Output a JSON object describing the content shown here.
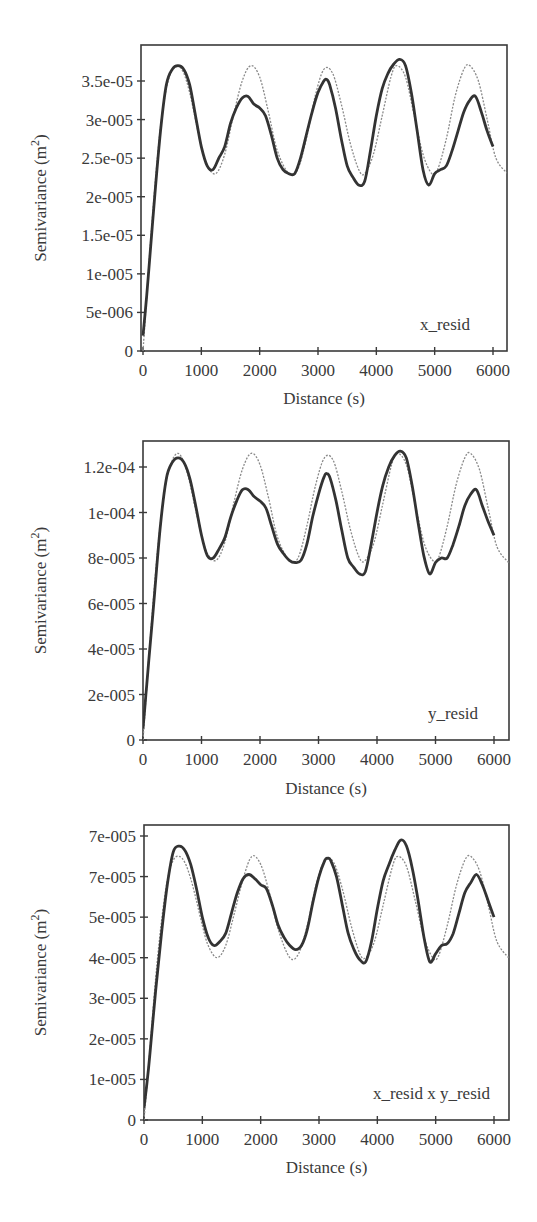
{
  "figure": {
    "x_axis_title": "Distance (s)",
    "y_axis_title": "Semivariance (m",
    "y_axis_title_sup": "2",
    "y_axis_title_end": ")"
  },
  "chart_data": [
    {
      "type": "line",
      "panel_label": "x_resid",
      "xlabel": "Distance (s)",
      "ylabel": "Semivariance (m^2)",
      "xlim": [
        0,
        6250
      ],
      "ylim": [
        0,
        3.85e-05
      ],
      "x_ticks": [
        0,
        1000,
        2000,
        3000,
        4000,
        5000,
        6000
      ],
      "x_tick_labels": [
        "0",
        "1000",
        "2000",
        "3000",
        "4000",
        "5000",
        "6000"
      ],
      "y_ticks": [
        0,
        5e-06,
        1e-05,
        1.5e-05,
        2e-05,
        2.5e-05,
        3e-05,
        3.5e-05
      ],
      "y_tick_labels": [
        "0",
        "5e-006",
        "1e-005",
        "1.5e-05",
        "2e-005",
        "2.5e-05",
        "3e-005",
        "3.5e-05"
      ],
      "grid": false,
      "series": [
        {
          "name": "empirical semivariogram",
          "style": "thick",
          "x": [
            0,
            50,
            100,
            200,
            300,
            400,
            500,
            600,
            700,
            800,
            900,
            1000,
            1100,
            1200,
            1300,
            1400,
            1500,
            1600,
            1700,
            1800,
            1900,
            2000,
            2100,
            2200,
            2300,
            2400,
            2500,
            2600,
            2700,
            2800,
            2900,
            3000,
            3100,
            3150,
            3200,
            3300,
            3400,
            3500,
            3600,
            3700,
            3800,
            3900,
            4000,
            4100,
            4200,
            4300,
            4400,
            4500,
            4600,
            4700,
            4800,
            4900,
            5000,
            5100,
            5200,
            5300,
            5400,
            5500,
            5600,
            5700,
            5800,
            5900,
            6000
          ],
          "values": [
            2e-06,
            6e-06,
            1.05e-05,
            2e-05,
            2.85e-05,
            3.45e-05,
            3.65e-05,
            3.7e-05,
            3.65e-05,
            3.45e-05,
            3.05e-05,
            2.65e-05,
            2.4e-05,
            2.35e-05,
            2.5e-05,
            2.65e-05,
            2.95e-05,
            3.15e-05,
            3.28e-05,
            3.3e-05,
            3.2e-05,
            3.15e-05,
            3.05e-05,
            2.8e-05,
            2.5e-05,
            2.35e-05,
            2.3e-05,
            2.3e-05,
            2.5e-05,
            2.8e-05,
            3.1e-05,
            3.35e-05,
            3.5e-05,
            3.52e-05,
            3.45e-05,
            3.15e-05,
            2.75e-05,
            2.4e-05,
            2.25e-05,
            2.15e-05,
            2.2e-05,
            2.6e-05,
            3.05e-05,
            3.4e-05,
            3.6e-05,
            3.72e-05,
            3.78e-05,
            3.7e-05,
            3.35e-05,
            2.85e-05,
            2.35e-05,
            2.15e-05,
            2.3e-05,
            2.35e-05,
            2.4e-05,
            2.6e-05,
            2.85e-05,
            3.1e-05,
            3.25e-05,
            3.3e-05,
            3.1e-05,
            2.85e-05,
            2.65e-05
          ]
        },
        {
          "name": "fitted hole-effect model",
          "style": "thin-dashed",
          "x": [
            0,
            100,
            200,
            300,
            400,
            500,
            600,
            700,
            800,
            900,
            1000,
            1100,
            1250,
            1400,
            1550,
            1700,
            1850,
            2000,
            2150,
            2300,
            2500,
            2650,
            2800,
            2950,
            3100,
            3250,
            3400,
            3550,
            3700,
            3800,
            3950,
            4100,
            4250,
            4350,
            4500,
            4650,
            4800,
            4950,
            5050,
            5200,
            5350,
            5500,
            5600,
            5750,
            5900,
            6050,
            6250
          ],
          "values": [
            0,
            1.1e-05,
            2.1e-05,
            2.9e-05,
            3.4e-05,
            3.65e-05,
            3.7e-05,
            3.6e-05,
            3.35e-05,
            3e-05,
            2.65e-05,
            2.4e-05,
            2.3e-05,
            2.55e-05,
            3.05e-05,
            3.5e-05,
            3.7e-05,
            3.55e-05,
            3.1e-05,
            2.6e-05,
            2.3e-05,
            2.35e-05,
            2.75e-05,
            3.3e-05,
            3.65e-05,
            3.6e-05,
            3.2e-05,
            2.7e-05,
            2.35e-05,
            2.3e-05,
            2.55e-05,
            3.05e-05,
            3.55e-05,
            3.7e-05,
            3.55e-05,
            3.05e-05,
            2.55e-05,
            2.3e-05,
            2.35e-05,
            2.75e-05,
            3.3e-05,
            3.65e-05,
            3.7e-05,
            3.5e-05,
            3e-05,
            2.5e-05,
            2.3e-05
          ]
        }
      ]
    },
    {
      "type": "line",
      "panel_label": "y_resid",
      "xlabel": "Distance (s)",
      "ylabel": "Semivariance (m^2)",
      "xlim": [
        0,
        6250
      ],
      "ylim": [
        0,
        0.000132
      ],
      "x_ticks": [
        0,
        1000,
        2000,
        3000,
        4000,
        5000,
        6000
      ],
      "x_tick_labels": [
        "0",
        "1000",
        "2000",
        "3000",
        "4000",
        "5000",
        "6000"
      ],
      "y_ticks": [
        0,
        2e-05,
        4e-05,
        6e-05,
        8e-05,
        0.0001,
        0.00012
      ],
      "y_tick_labels": [
        "0",
        "2e-005",
        "4e-005",
        "6e-005",
        "8e-005",
        "1e-004",
        "1.2e-04"
      ],
      "grid": false,
      "series": [
        {
          "name": "empirical semivariogram",
          "style": "thick",
          "x": [
            0,
            50,
            100,
            200,
            300,
            400,
            500,
            600,
            700,
            800,
            900,
            1000,
            1100,
            1200,
            1300,
            1400,
            1500,
            1600,
            1700,
            1800,
            1900,
            2000,
            2100,
            2200,
            2300,
            2400,
            2500,
            2600,
            2700,
            2800,
            2900,
            3000,
            3100,
            3150,
            3200,
            3300,
            3400,
            3500,
            3600,
            3700,
            3800,
            3900,
            4000,
            4100,
            4200,
            4300,
            4400,
            4500,
            4600,
            4700,
            4800,
            4900,
            5000,
            5100,
            5200,
            5300,
            5400,
            5500,
            5600,
            5700,
            5800,
            5900,
            6000
          ],
          "values": [
            5e-06,
            2e-05,
            3.5e-05,
            6.5e-05,
            9.5e-05,
            0.000115,
            0.000122,
            0.000124,
            0.000122,
            0.000115,
            0.000103,
            9e-05,
            8.1e-05,
            8e-05,
            8.4e-05,
            8.9e-05,
            9.8e-05,
            0.000105,
            0.00011,
            0.00011,
            0.000107,
            0.000105,
            0.000102,
            9.4e-05,
            8.6e-05,
            8.2e-05,
            7.9e-05,
            7.8e-05,
            7.9e-05,
            8.6e-05,
            9.8e-05,
            0.000108,
            0.000116,
            0.000117,
            0.000115,
            0.000105,
            9.2e-05,
            8e-05,
            7.6e-05,
            7.3e-05,
            7.4e-05,
            8.6e-05,
            0.0001,
            0.000112,
            0.00012,
            0.000125,
            0.000127,
            0.000124,
            0.000112,
            9.6e-05,
            8.1e-05,
            7.3e-05,
            7.8e-05,
            8e-05,
            8e-05,
            8.6e-05,
            9.4e-05,
            0.000103,
            0.000108,
            0.00011,
            0.000103,
            9.6e-05,
            9e-05
          ]
        },
        {
          "name": "fitted hole-effect model",
          "style": "thin-dashed",
          "x": [
            0,
            100,
            200,
            300,
            400,
            500,
            600,
            700,
            800,
            900,
            1000,
            1100,
            1250,
            1400,
            1550,
            1700,
            1850,
            2000,
            2150,
            2300,
            2500,
            2650,
            2800,
            2950,
            3100,
            3250,
            3400,
            3550,
            3700,
            3800,
            3950,
            4100,
            4250,
            4350,
            4500,
            4650,
            4800,
            4950,
            5050,
            5200,
            5350,
            5500,
            5600,
            5750,
            5900,
            6050,
            6250
          ],
          "values": [
            0,
            3.6e-05,
            6.9e-05,
            9.6e-05,
            0.000114,
            0.000123,
            0.000126,
            0.000122,
            0.000113,
            0.000101,
            9e-05,
            8.2e-05,
            7.9e-05,
            8.7e-05,
            0.000104,
            0.000119,
            0.000126,
            0.000121,
            0.000106,
            8.9e-05,
            7.9e-05,
            8e-05,
            9.4e-05,
            0.000112,
            0.000124,
            0.000123,
            0.000109,
            9.2e-05,
            8e-05,
            7.9e-05,
            8.7e-05,
            0.000104,
            0.000121,
            0.000126,
            0.000121,
            0.000104,
            8.7e-05,
            7.9e-05,
            8e-05,
            9.4e-05,
            0.000112,
            0.000124,
            0.000126,
            0.000119,
            0.000102,
            8.5e-05,
            7.8e-05
          ]
        }
      ]
    },
    {
      "type": "line",
      "panel_label": "x_resid x y_resid",
      "xlabel": "Distance (s)",
      "ylabel": "Semivariance (m^2)",
      "xlim": [
        0,
        6250
      ],
      "ylim": [
        0,
        7.3e-05
      ],
      "x_ticks": [
        0,
        1000,
        2000,
        3000,
        4000,
        5000,
        6000
      ],
      "x_tick_labels": [
        "0",
        "1000",
        "2000",
        "3000",
        "4000",
        "5000",
        "6000"
      ],
      "y_ticks": [
        0,
        1e-05,
        2e-05,
        3e-05,
        4e-05,
        5e-05,
        6e-05,
        7e-05
      ],
      "y_tick_labels": [
        "0",
        "1e-005",
        "2e-005",
        "3e-005",
        "4e-005",
        "5e-005",
        "7e-005",
        "7e-005"
      ],
      "grid": false,
      "series": [
        {
          "name": "empirical semivariogram",
          "style": "thick",
          "x": [
            0,
            50,
            100,
            200,
            300,
            400,
            500,
            600,
            700,
            800,
            900,
            1000,
            1100,
            1200,
            1300,
            1400,
            1500,
            1600,
            1700,
            1800,
            1900,
            2000,
            2100,
            2200,
            2300,
            2400,
            2500,
            2600,
            2700,
            2800,
            2900,
            3000,
            3100,
            3150,
            3200,
            3300,
            3400,
            3500,
            3600,
            3700,
            3800,
            3900,
            4000,
            4100,
            4200,
            4300,
            4400,
            4500,
            4600,
            4700,
            4800,
            4900,
            5000,
            5100,
            5200,
            5300,
            5400,
            5500,
            5600,
            5700,
            5800,
            5900,
            6000
          ],
          "values": [
            3e-06,
            9e-06,
            1.6e-05,
            3.2e-05,
            4.6e-05,
            5.8e-05,
            6.6e-05,
            6.75e-05,
            6.65e-05,
            6.3e-05,
            5.7e-05,
            5e-05,
            4.5e-05,
            4.3e-05,
            4.4e-05,
            4.6e-05,
            5.1e-05,
            5.6e-05,
            5.95e-05,
            6.05e-05,
            5.95e-05,
            5.8e-05,
            5.7e-05,
            5.3e-05,
            4.8e-05,
            4.5e-05,
            4.3e-05,
            4.2e-05,
            4.3e-05,
            4.7e-05,
            5.4e-05,
            6e-05,
            6.4e-05,
            6.45e-05,
            6.4e-05,
            6e-05,
            5.3e-05,
            4.6e-05,
            4.2e-05,
            3.95e-05,
            3.9e-05,
            4.4e-05,
            5.2e-05,
            5.9e-05,
            6.3e-05,
            6.65e-05,
            6.9e-05,
            6.75e-05,
            6.2e-05,
            5.4e-05,
            4.5e-05,
            3.9e-05,
            4.1e-05,
            4.3e-05,
            4.35e-05,
            4.6e-05,
            5.1e-05,
            5.6e-05,
            5.85e-05,
            6.05e-05,
            5.8e-05,
            5.4e-05,
            5e-05
          ]
        },
        {
          "name": "fitted hole-effect model",
          "style": "thin-dashed",
          "x": [
            0,
            100,
            200,
            300,
            400,
            500,
            600,
            700,
            800,
            900,
            1000,
            1100,
            1250,
            1400,
            1550,
            1700,
            1850,
            2000,
            2150,
            2300,
            2500,
            2650,
            2800,
            2950,
            3100,
            3250,
            3400,
            3550,
            3700,
            3800,
            3950,
            4100,
            4250,
            4350,
            4500,
            4650,
            4800,
            4950,
            5050,
            5200,
            5350,
            5500,
            5600,
            5750,
            5900,
            6050,
            6250
          ],
          "values": [
            0,
            1.7e-05,
            3.5e-05,
            4.9e-05,
            5.9e-05,
            6.4e-05,
            6.5e-05,
            6.35e-05,
            5.95e-05,
            5.4e-05,
            4.8e-05,
            4.3e-05,
            4e-05,
            4.3e-05,
            5.1e-05,
            5.95e-05,
            6.5e-05,
            6.3e-05,
            5.6e-05,
            4.7e-05,
            4e-05,
            4.1e-05,
            4.8e-05,
            5.8e-05,
            6.4e-05,
            6.35e-05,
            5.7e-05,
            4.8e-05,
            4.1e-05,
            4e-05,
            4.4e-05,
            5.3e-05,
            6.2e-05,
            6.5e-05,
            6.25e-05,
            5.4e-05,
            4.5e-05,
            4e-05,
            4.05e-05,
            4.8e-05,
            5.75e-05,
            6.4e-05,
            6.5e-05,
            6.15e-05,
            5.3e-05,
            4.4e-05,
            4e-05
          ]
        }
      ]
    }
  ],
  "layout": {
    "panels": [
      {
        "left": 141,
        "top": 45,
        "right": 507,
        "bottom": 351,
        "x0": 143,
        "x6000": 493,
        "y_zero": 351,
        "y_top_val": 3.5e-05,
        "y_top_px": 81,
        "label_x": 470,
        "label_y": 330,
        "xlabel_y": 404
      },
      {
        "left": 143,
        "top": 441,
        "right": 509,
        "bottom": 740,
        "x0": 143,
        "x6000": 494,
        "y_zero": 740,
        "y_top_val": 0.00012,
        "y_top_px": 467,
        "label_x": 478,
        "label_y": 719,
        "xlabel_y": 794
      },
      {
        "left": 144,
        "top": 825,
        "right": 509,
        "bottom": 1120,
        "x0": 144,
        "x6000": 494,
        "y_zero": 1120,
        "y_top_val": 7e-05,
        "y_top_px": 836,
        "label_x": 490,
        "label_y": 1099,
        "xlabel_y": 1173
      }
    ]
  }
}
